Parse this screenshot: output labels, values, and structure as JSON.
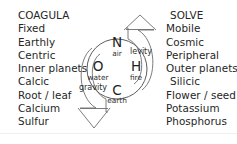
{
  "diagram": {
    "left_column": {
      "heading": "COAGULA",
      "items": [
        "Fixed",
        "Earthly",
        "Centric",
        "Inner planets",
        "Calcic",
        "Root / leaf",
        "Calcium",
        "Sulfur"
      ]
    },
    "right_column": {
      "heading": "SOLVE",
      "items": [
        "Mobile",
        "Cosmic",
        "Peripheral",
        "Outer planets",
        "Silicic",
        "Flower / seed",
        "Potassium",
        "Phosphorus"
      ]
    },
    "elements": [
      {
        "symbol": "N",
        "name": "air",
        "position": "top"
      },
      {
        "symbol": "O",
        "name": "water",
        "position": "left"
      },
      {
        "symbol": "H",
        "name": "fire",
        "position": "right"
      },
      {
        "symbol": "C",
        "name": "earth",
        "position": "bottom"
      }
    ],
    "forces": [
      {
        "label": "levity",
        "direction": "up",
        "side": "right"
      },
      {
        "label": "gravity",
        "direction": "down",
        "side": "left"
      }
    ],
    "colors": {
      "text": "#262626",
      "glyph": "#1f1f1f",
      "stroke": "#4a4a4a",
      "arrow": "#6d6d6d",
      "background": "#ffffff"
    }
  }
}
